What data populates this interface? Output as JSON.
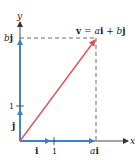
{
  "diagram": {
    "type": "vector-decomposition",
    "axes": {
      "x_label": "x",
      "y_label": "y"
    },
    "unit_vectors": {
      "i_label": "i",
      "j_label": "j",
      "x_tick_label": "1",
      "y_tick_label": "1"
    },
    "components": {
      "x_component_label_a": "a",
      "x_component_label_i": "i",
      "y_component_label_b": "b",
      "y_component_label_j": "j"
    },
    "vector": {
      "label_v": "v",
      "label_eq": " = ",
      "label_a": "a",
      "label_i": "i",
      "label_plus": " + ",
      "label_b": "b",
      "label_j": "j"
    },
    "colors": {
      "axis": "#333333",
      "component": "#3a7fd0",
      "vector": "#e0525a",
      "dashed": "#444444"
    }
  }
}
